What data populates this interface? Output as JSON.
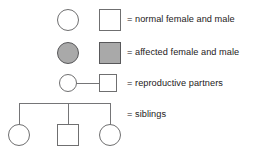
{
  "figure": {
    "background_color": "#ffffff",
    "text_color": "#242021",
    "outline_color": "#6f6f70",
    "affected_fill_color": "#a9a9a9",
    "connector_color": "#757577"
  },
  "rows": [
    {
      "key": "normal",
      "label": "= normal female and male",
      "female_symbol": "open-circle",
      "male_symbol": "open-square",
      "fill": "none"
    },
    {
      "key": "affected",
      "label": "= affected female and male",
      "female_symbol": "filled-circle",
      "male_symbol": "filled-square",
      "fill": "gray"
    },
    {
      "key": "partners",
      "label": "= reproductive partners",
      "female_symbol": "open-circle",
      "male_symbol": "open-square",
      "connector": "horizontal-mating-line"
    },
    {
      "key": "siblings",
      "label": "= siblings",
      "sibship_members": [
        "open-circle",
        "open-square",
        "open-circle"
      ],
      "connector": "sibship-bar-with-three-drop-lines"
    }
  ]
}
